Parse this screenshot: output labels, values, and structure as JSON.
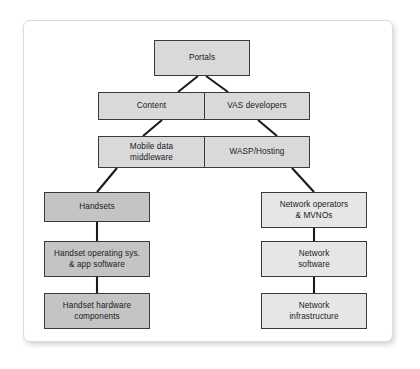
{
  "diagram": {
    "type": "hierarchy-tree",
    "colors": {
      "box_fill_light": "#e6e6e6",
      "box_fill_mid": "#d9d9d9",
      "box_fill_dark": "#c4c4c4",
      "box_border": "#3a3a3a",
      "connector": "#1a1a1a",
      "frame_border": "#dcdcdc",
      "page_background": "#ffffff",
      "text": "#1a1a1a"
    },
    "nodes": [
      {
        "id": "portals",
        "label": "Portals",
        "tone": "mid"
      },
      {
        "id": "content",
        "label": "Content",
        "tone": "mid"
      },
      {
        "id": "vas_developers",
        "label": "VAS developers",
        "tone": "mid"
      },
      {
        "id": "mobile_middleware",
        "label": "Mobile data\nmiddleware",
        "tone": "mid"
      },
      {
        "id": "wasp_hosting",
        "label": "WASP/Hosting",
        "tone": "mid"
      },
      {
        "id": "handsets",
        "label": "Handsets",
        "tone": "dark"
      },
      {
        "id": "handset_os",
        "label": "Handset operating sys.\n& app software",
        "tone": "dark"
      },
      {
        "id": "handset_hardware",
        "label": "Handset hardware\ncomponents",
        "tone": "dark"
      },
      {
        "id": "network_operators",
        "label": "Network operators\n& MVNOs",
        "tone": "light"
      },
      {
        "id": "network_software",
        "label": "Network\nsoftware",
        "tone": "light"
      },
      {
        "id": "network_infra",
        "label": "Network\ninfrastructure",
        "tone": "light"
      }
    ],
    "edges": [
      {
        "from": "portals",
        "to": "content",
        "style": "diagonal"
      },
      {
        "from": "portals",
        "to": "vas_developers",
        "style": "diagonal"
      },
      {
        "from": "content",
        "to": "mobile_middleware",
        "style": "diagonal"
      },
      {
        "from": "vas_developers",
        "to": "wasp_hosting",
        "style": "diagonal"
      },
      {
        "from": "mobile_middleware",
        "to": "handsets",
        "style": "diagonal"
      },
      {
        "from": "wasp_hosting",
        "to": "network_operators",
        "style": "diagonal"
      },
      {
        "from": "handsets",
        "to": "handset_os",
        "style": "vertical"
      },
      {
        "from": "handset_os",
        "to": "handset_hardware",
        "style": "vertical"
      },
      {
        "from": "network_operators",
        "to": "network_software",
        "style": "vertical"
      },
      {
        "from": "network_software",
        "to": "network_infra",
        "style": "vertical"
      }
    ]
  }
}
